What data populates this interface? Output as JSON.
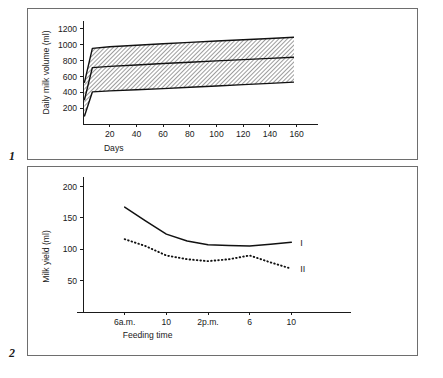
{
  "figure": {
    "panel_numbers": [
      "1",
      "2"
    ]
  },
  "chart_data": [
    {
      "type": "area",
      "panel": "1",
      "title": "",
      "xlabel": "Days",
      "ylabel": "Daily milk volume (ml)",
      "xlim": [
        0,
        170
      ],
      "ylim": [
        0,
        1300
      ],
      "xticks": [
        20,
        40,
        60,
        80,
        100,
        120,
        140,
        160
      ],
      "xticklabels": [
        "20",
        "40",
        "60",
        "80",
        "100",
        "120",
        "140",
        "160"
      ],
      "yticks": [
        200,
        400,
        600,
        800,
        1000,
        1200
      ],
      "yticklabels": [
        "200",
        "400",
        "600",
        "800",
        "1000",
        "1200"
      ],
      "grid": false,
      "legend": "none",
      "x": [
        1,
        7,
        20,
        40,
        60,
        80,
        100,
        120,
        140,
        158
      ],
      "series": [
        {
          "name": "upper limit",
          "style": "solid",
          "values": [
            520,
            955,
            975,
            993,
            1012,
            1030,
            1047,
            1063,
            1080,
            1095
          ]
        },
        {
          "name": "mean",
          "style": "solid",
          "values": [
            300,
            712,
            727,
            745,
            763,
            780,
            797,
            812,
            828,
            842
          ]
        },
        {
          "name": "lower limit",
          "style": "solid",
          "values": [
            95,
            405,
            418,
            432,
            447,
            463,
            480,
            497,
            513,
            528
          ]
        }
      ],
      "band": {
        "name": "range band",
        "fill": "hatched",
        "between": [
          "upper limit",
          "lower limit"
        ]
      },
      "annotation": "Hatched band spans upper and lower limits; central line is the mean daily milk volume."
    },
    {
      "type": "line",
      "panel": "2",
      "title": "",
      "xlabel": "Feeding time",
      "ylabel": "Milk yield (ml)",
      "xlim": [
        0,
        6
      ],
      "ylim": [
        0,
        215
      ],
      "xticks": [
        1,
        2,
        3,
        4,
        5
      ],
      "xticklabels": [
        "6a.m.",
        "10",
        "2p.m.",
        "6",
        "10"
      ],
      "yticks": [
        50,
        100,
        150,
        200
      ],
      "yticklabels": [
        "50",
        "100",
        "150",
        "200"
      ],
      "grid": false,
      "legend": "inline-right",
      "x": [
        1,
        1.5,
        2,
        2.5,
        3,
        3.5,
        4,
        4.5,
        5
      ],
      "series": [
        {
          "name": "I",
          "style": "solid",
          "label": "I",
          "values": [
            167,
            145,
            124,
            113,
            107,
            106,
            105,
            108,
            111
          ]
        },
        {
          "name": "II",
          "style": "dotted",
          "label": "II",
          "values": [
            116,
            105,
            90,
            84,
            81,
            84,
            90,
            79,
            69
          ]
        }
      ]
    }
  ]
}
